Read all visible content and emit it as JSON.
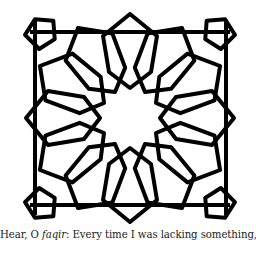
{
  "illustration": {
    "description": "Islamic geometric pattern: 12-point star rosette surrounded by interlaced five-point stars",
    "stroke_color": "#000000",
    "background_color": "#ffffff"
  },
  "caption": {
    "prefix": "Hear, O ",
    "italic_word": "faqir",
    "suffix": ": Every time I was lacking something,"
  }
}
